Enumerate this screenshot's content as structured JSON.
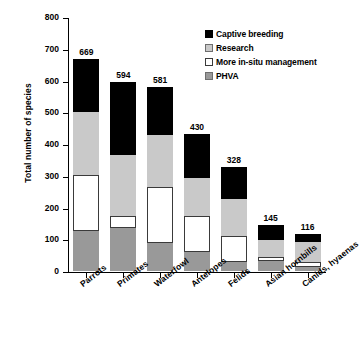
{
  "chart_data": {
    "type": "bar",
    "stacked": true,
    "title": "",
    "xlabel": "",
    "ylabel": "Total number of species",
    "ylim": [
      0,
      800
    ],
    "ytick_step": 100,
    "yticks": [
      0,
      100,
      200,
      300,
      400,
      500,
      600,
      700,
      800
    ],
    "grid": false,
    "legend_position": "top-right",
    "categories": [
      "Parrots",
      "Primates",
      "Waterfowl",
      "Antelopes",
      "Felids",
      "Asian hornbills",
      "Canids, hyaenas"
    ],
    "series": [
      {
        "name": "PHVA",
        "color": "#999999",
        "values": [
          125,
          134,
          89,
          61,
          29,
          33,
          14
        ]
      },
      {
        "name": "More in-situ management",
        "color": "#ffffff",
        "values": [
          177,
          38,
          176,
          111,
          81,
          12,
          13
        ]
      },
      {
        "name": "Research",
        "color": "#c9c9c9",
        "values": [
          198,
          193,
          163,
          120,
          117,
          52,
          64
        ]
      },
      {
        "name": "Captive breeding",
        "color": "#000000",
        "values": [
          169,
          229,
          153,
          138,
          101,
          48,
          25
        ]
      }
    ],
    "totals": [
      669,
      594,
      581,
      430,
      328,
      145,
      116
    ],
    "total_labels": [
      "669",
      "594",
      "581",
      "430",
      "328",
      "145",
      "116"
    ],
    "legend_entries": [
      {
        "label": "Captive breeding",
        "color": "#000000"
      },
      {
        "label": "Research",
        "color": "#c9c9c9"
      },
      {
        "label": "More in-situ management",
        "color": "#ffffff"
      },
      {
        "label": "PHVA",
        "color": "#999999"
      }
    ]
  }
}
